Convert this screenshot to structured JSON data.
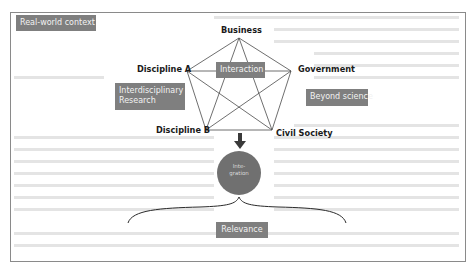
{
  "context_label": "Real-world context",
  "pentagon": {
    "center_label": "Interaction",
    "nodes": {
      "top": "Business",
      "right": "Government",
      "bottom_right": "Civil Society",
      "bottom_left": "Discipline B",
      "left": "Discipline A"
    }
  },
  "left_region_label": "Interdisciplinary Research",
  "left_region_lines": [
    "Interdisciplinary",
    "Research"
  ],
  "right_region_label": "Beyond science",
  "integration": {
    "label": "Integration",
    "lines": [
      "Inte-",
      "gration"
    ]
  },
  "relevance_label": "Relevance",
  "colors": {
    "tag_fill": "#7f7f7f",
    "tag_text": "#f2f2f2",
    "circle_fill": "#707070",
    "line": "#4a4a4a",
    "frame": "#8a8a8a"
  }
}
